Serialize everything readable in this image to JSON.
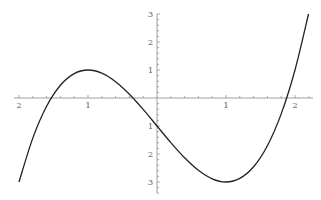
{
  "chart_data": {
    "type": "line",
    "title": "",
    "xlabel": "",
    "ylabel": "",
    "function": "x^3 - 3x - 1",
    "xlim": [
      -2.05,
      2.25
    ],
    "ylim": [
      -3.4,
      3.0
    ],
    "grid": false,
    "legend": null,
    "x_ticks": [
      {
        "value": -2,
        "label": "2"
      },
      {
        "value": -1,
        "label": "1"
      },
      {
        "value": 1,
        "label": "1"
      },
      {
        "value": 2,
        "label": "2"
      }
    ],
    "y_ticks": [
      {
        "value": 3,
        "label": "3"
      },
      {
        "value": 2,
        "label": "2"
      },
      {
        "value": 1,
        "label": "1"
      },
      {
        "value": -1,
        "label": "1"
      },
      {
        "value": -2,
        "label": "2"
      },
      {
        "value": -3,
        "label": "3"
      }
    ],
    "minor_tick_step": 0.2,
    "series": [
      {
        "name": "f(x)",
        "color": "#222222",
        "x": [
          -2.0,
          -1.8,
          -1.6,
          -1.4,
          -1.2,
          -1.0,
          -0.8,
          -0.6,
          -0.4,
          -0.2,
          0.0,
          0.2,
          0.4,
          0.6,
          0.8,
          1.0,
          1.2,
          1.4,
          1.6,
          1.8,
          2.0,
          2.196
        ],
        "y": [
          -3.0,
          -1.432,
          -0.296,
          0.456,
          0.872,
          1.0,
          0.888,
          0.584,
          0.136,
          -0.408,
          -1.0,
          -1.592,
          -2.136,
          -2.584,
          -2.888,
          -3.0,
          -2.872,
          -2.456,
          -1.704,
          -0.568,
          1.0,
          3.0
        ]
      }
    ]
  },
  "axes": {
    "color": "#888888",
    "label_color": "#555555"
  }
}
